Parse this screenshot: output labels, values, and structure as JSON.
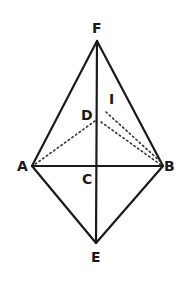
{
  "diagram": {
    "type": "geometry-figure",
    "colors": {
      "line": "#1a1a1a",
      "dotted": "#333333",
      "background": "#ffffff"
    },
    "points": {
      "F": {
        "label": "F",
        "x": 97,
        "y": 41
      },
      "A": {
        "label": "A",
        "x": 32,
        "y": 166
      },
      "B": {
        "label": "B",
        "x": 163,
        "y": 166
      },
      "C": {
        "label": "C",
        "x": 97,
        "y": 166
      },
      "D": {
        "label": "D",
        "x": 97,
        "y": 121
      },
      "I": {
        "label": "I",
        "x": 106,
        "y": 112
      },
      "E": {
        "label": "E",
        "x": 96,
        "y": 243
      }
    },
    "solid_segments": [
      "FA",
      "FB",
      "FE",
      "AB",
      "AE",
      "BE"
    ],
    "dotted_segments": [
      "DA",
      "DB",
      "IB"
    ]
  }
}
